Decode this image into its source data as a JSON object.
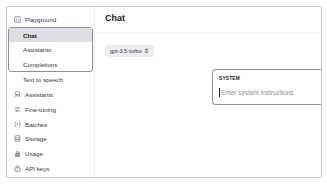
{
  "sidebar": {
    "items": [
      {
        "label": "Playground",
        "icon": "playground-icon"
      },
      {
        "label": "Chat",
        "active": true
      },
      {
        "label": "Assistants"
      },
      {
        "label": "Completions"
      },
      {
        "label": "Text to speech"
      },
      {
        "label": "Assistants",
        "icon": "assistants-icon"
      },
      {
        "label": "Fine-tuning",
        "icon": "fine-tuning-icon"
      },
      {
        "label": "Batches",
        "icon": "batches-icon"
      },
      {
        "label": "Storage",
        "icon": "storage-icon"
      },
      {
        "label": "Usage",
        "icon": "usage-icon"
      },
      {
        "label": "API keys",
        "icon": "api-keys-icon"
      }
    ]
  },
  "main": {
    "title": "Chat",
    "model_select": {
      "value": "gpt-3.5-turbo",
      "icon": "⇕"
    },
    "system": {
      "label": "SYSTEM",
      "placeholder": "Enter system instructions"
    }
  }
}
